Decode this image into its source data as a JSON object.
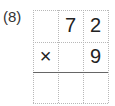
{
  "problem": {
    "label": "(8)",
    "rows": [
      [
        "",
        "7",
        "2"
      ],
      [
        "×",
        "",
        "9"
      ],
      [
        "",
        "",
        ""
      ]
    ]
  }
}
